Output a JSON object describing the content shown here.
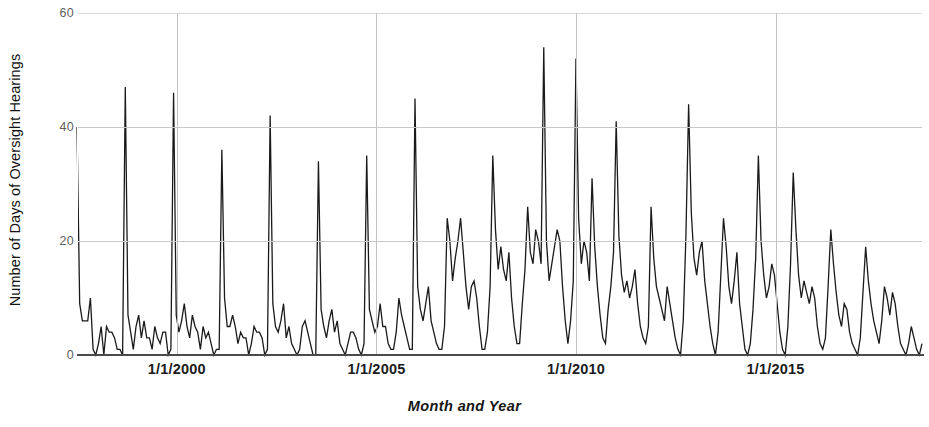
{
  "chart_data": {
    "type": "line",
    "title": "",
    "subtitle": "",
    "xlabel": "Month and Year",
    "ylabel": "Number of Days of Oversight Hearings",
    "ylim": [
      0,
      60
    ],
    "yticks": [
      0,
      20,
      40,
      60
    ],
    "ytick_labels": [
      "0",
      "20",
      "40",
      "60"
    ],
    "xtick_labels": [
      "1/1/2000",
      "1/1/2005",
      "1/1/2010",
      "1/1/2015"
    ],
    "xtick_values": [
      "2000-01",
      "2005-01",
      "2010-01",
      "2015-01"
    ],
    "x_start": "1997-07",
    "x_end": "2018-09",
    "x_unit": "month",
    "grid": {
      "horizontal": true,
      "vertical": true
    },
    "legend": {
      "show": false,
      "position": "none"
    },
    "line_color": "#1a1a1a",
    "line_width": 1.3,
    "series": [
      {
        "name": "Days of Oversight Hearings",
        "values": [
          40,
          9,
          6,
          6,
          6,
          10,
          1,
          0,
          2,
          5,
          0,
          5,
          4,
          4,
          3,
          1,
          1,
          0,
          47,
          7,
          4,
          1,
          5,
          7,
          3,
          6,
          3,
          3,
          1,
          5,
          3,
          2,
          4,
          4,
          0,
          1,
          46,
          7,
          4,
          6,
          9,
          5,
          3,
          7,
          5,
          4,
          1,
          5,
          3,
          4,
          2,
          0,
          1,
          1,
          36,
          10,
          5,
          5,
          7,
          5,
          2,
          4,
          3,
          3,
          0,
          2,
          5,
          4,
          4,
          3,
          0,
          1,
          42,
          9,
          5,
          4,
          6,
          9,
          3,
          5,
          2,
          1,
          0,
          1,
          5,
          6,
          4,
          2,
          0,
          0,
          34,
          8,
          5,
          3,
          6,
          8,
          4,
          6,
          2,
          1,
          0,
          2,
          4,
          4,
          3,
          1,
          0,
          2,
          35,
          8,
          6,
          4,
          5,
          9,
          5,
          5,
          2,
          1,
          1,
          4,
          10,
          7,
          5,
          3,
          1,
          1,
          45,
          12,
          8,
          6,
          9,
          12,
          6,
          4,
          2,
          1,
          1,
          5,
          24,
          20,
          13,
          17,
          20,
          24,
          18,
          12,
          8,
          12,
          13,
          10,
          5,
          1,
          1,
          4,
          12,
          35,
          22,
          15,
          19,
          15,
          13,
          18,
          10,
          5,
          2,
          2,
          9,
          15,
          26,
          18,
          16,
          22,
          20,
          16,
          54,
          20,
          13,
          16,
          19,
          22,
          20,
          12,
          6,
          2,
          6,
          13,
          52,
          24,
          16,
          20,
          18,
          13,
          31,
          19,
          12,
          7,
          3,
          2,
          8,
          12,
          18,
          41,
          21,
          14,
          11,
          13,
          10,
          12,
          15,
          9,
          5,
          3,
          2,
          5,
          26,
          17,
          12,
          10,
          8,
          6,
          12,
          9,
          6,
          3,
          1,
          0,
          6,
          21,
          44,
          25,
          17,
          14,
          18,
          20,
          13,
          9,
          5,
          2,
          0,
          4,
          14,
          24,
          19,
          12,
          9,
          13,
          18,
          9,
          5,
          1,
          0,
          2,
          8,
          17,
          35,
          20,
          14,
          10,
          12,
          16,
          14,
          9,
          4,
          1,
          0,
          5,
          16,
          32,
          22,
          14,
          10,
          13,
          11,
          9,
          12,
          10,
          5,
          2,
          1,
          3,
          12,
          22,
          16,
          11,
          7,
          5,
          9,
          8,
          4,
          2,
          1,
          0,
          3,
          11,
          19,
          13,
          9,
          6,
          4,
          2,
          6,
          12,
          10,
          7,
          11,
          9,
          5,
          2,
          1,
          0,
          2,
          5,
          3,
          1,
          0,
          2
        ]
      }
    ],
    "notable_peaks": [
      {
        "label": "max",
        "value": 54,
        "x": "2007-02"
      },
      {
        "label": "second",
        "value": 52,
        "x": "2008-01"
      },
      {
        "label": "1998 peak",
        "value": 47,
        "x": "1998-02"
      },
      {
        "label": "1999 peak",
        "value": 46,
        "x": "1999-02"
      },
      {
        "label": "2011 peak",
        "value": 44,
        "x": "2011-11"
      }
    ]
  }
}
